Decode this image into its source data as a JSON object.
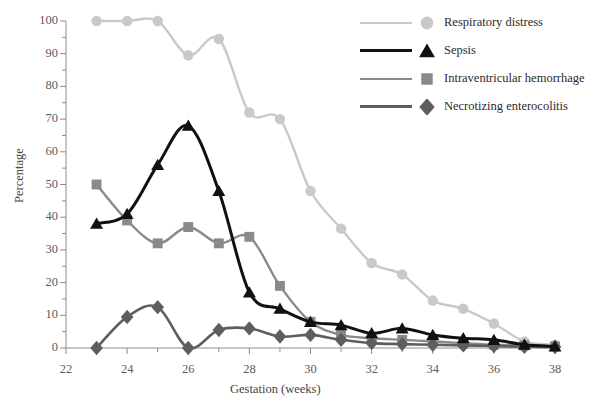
{
  "chart_data": {
    "type": "line",
    "title": "",
    "xlabel": "Gestation (weeks)",
    "ylabel": "Percentage",
    "xlim": [
      22,
      38
    ],
    "ylim": [
      0,
      100
    ],
    "xticks": [
      22,
      24,
      26,
      28,
      30,
      32,
      34,
      36,
      38
    ],
    "yticks": [
      0,
      10,
      20,
      30,
      40,
      50,
      60,
      70,
      80,
      90,
      100
    ],
    "x_minor_step": 1,
    "y_minor_step": 5,
    "grid": false,
    "legend_position": "top-right",
    "x": [
      23,
      24,
      25,
      26,
      27,
      28,
      29,
      30,
      31,
      32,
      33,
      34,
      35,
      36,
      37,
      38
    ],
    "series": [
      {
        "name": "Respiratory distress",
        "marker": "circle",
        "color": "#c9c9c9",
        "values": [
          100,
          100,
          100,
          89.5,
          94.5,
          72,
          70,
          48,
          36.5,
          26,
          22.5,
          14.5,
          12,
          7.5,
          2,
          1
        ]
      },
      {
        "name": "Sepsis",
        "marker": "triangle",
        "color": "#111111",
        "values": [
          38,
          41,
          56,
          68,
          48,
          17,
          12,
          8,
          7,
          4.5,
          6,
          4,
          3,
          2.5,
          1,
          0.5
        ]
      },
      {
        "name": "Intraventricular hemorrhage",
        "marker": "square",
        "color": "#8a8a8a",
        "values": [
          50,
          39,
          32,
          37,
          32,
          34,
          19,
          8,
          4,
          3,
          2.5,
          2,
          1.5,
          1,
          0.8,
          0.5
        ]
      },
      {
        "name": "Necrotizing enterocolitis",
        "marker": "diamond",
        "color": "#5e5e5e",
        "values": [
          0,
          9.5,
          12.5,
          0,
          5.5,
          6,
          3.5,
          4,
          2.5,
          1.5,
          1.2,
          1,
          0.8,
          0.6,
          0.4,
          0.3
        ]
      }
    ]
  },
  "axes": {
    "y_title": "Percentage",
    "x_title": "Gestation (weeks)",
    "y_tick_labels": [
      "100",
      "90",
      "80",
      "70",
      "60",
      "50",
      "40",
      "30",
      "20",
      "10",
      "0"
    ],
    "x_tick_labels": [
      "22",
      "24",
      "26",
      "28",
      "30",
      "32",
      "34",
      "36",
      "38"
    ]
  },
  "legend": {
    "entries": [
      {
        "label": "Respiratory distress",
        "color": "#c9c9c9",
        "marker": "circle",
        "line_width": "2.5px"
      },
      {
        "label": "Sepsis",
        "color": "#111111",
        "marker": "triangle",
        "line_width": "3.5px"
      },
      {
        "label": "Intraventricular hemorrhage",
        "color": "#8a8a8a",
        "marker": "square",
        "line_width": "2.5px"
      },
      {
        "label": "Necrotizing enterocolitis",
        "color": "#5e5e5e",
        "marker": "diamond",
        "line_width": "3px"
      }
    ]
  },
  "colors": {
    "axis": "#8d8d8d",
    "text": "#444444",
    "background": "#ffffff"
  }
}
